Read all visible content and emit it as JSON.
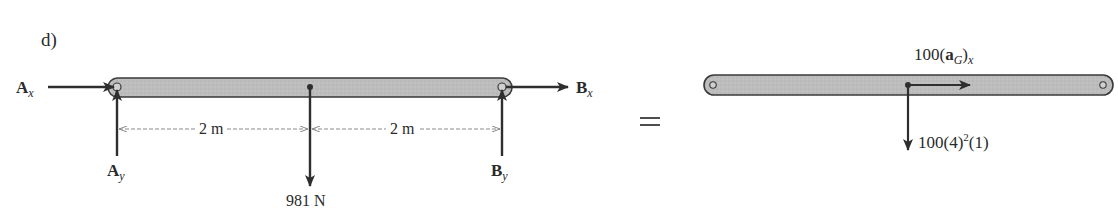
{
  "figure": {
    "part_label": "d)",
    "equals_sign": "="
  },
  "free_body_diagram": {
    "forces": {
      "ax": {
        "symbol": "A",
        "subscript": "x"
      },
      "ay": {
        "symbol": "A",
        "subscript": "y"
      },
      "bx": {
        "symbol": "B",
        "subscript": "x"
      },
      "by": {
        "symbol": "B",
        "subscript": "y"
      },
      "weight": "981 N"
    },
    "dimensions": {
      "left_span": "2 m",
      "right_span": "2 m"
    }
  },
  "kinetic_diagram": {
    "tangential": {
      "prefix": "100(",
      "bold": "a",
      "subscript": "G",
      "close": ")",
      "subscript2": "x"
    },
    "normal": {
      "prefix": "100(4)",
      "exponent": "2",
      "suffix": "(1)"
    }
  },
  "colors": {
    "bar_fill": "#b9b9b9",
    "bar_stroke": "#3a3a3a",
    "arrow": "#2e2e2e",
    "dimension_line": "#8a8a8a"
  }
}
